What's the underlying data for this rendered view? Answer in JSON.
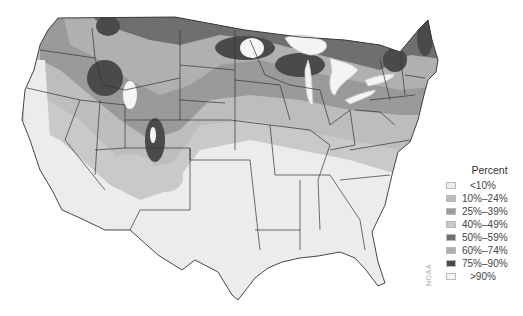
{
  "map": {
    "subject": "Contiguous United States",
    "colors": {
      "lt10": "#ececec",
      "p10_24": "#bdbdbd",
      "p25_39": "#9a9a9a",
      "p40_49": "#c9c9c9",
      "p50_59": "#6f6f6f",
      "p60_74": "#b0b0b0",
      "p75_90": "#4a4a4a",
      "gt90": "#f5f5f5",
      "border": "#333333",
      "lakes": "#f4f4f4"
    }
  },
  "legend": {
    "title": "Percent",
    "items": [
      {
        "label": "<10%",
        "color": "#ececec"
      },
      {
        "label": "10%–24%",
        "color": "#bdbdbd"
      },
      {
        "label": "25%–39%",
        "color": "#9a9a9a"
      },
      {
        "label": "40%–49%",
        "color": "#c9c9c9"
      },
      {
        "label": "50%–59%",
        "color": "#6f6f6f"
      },
      {
        "label": "60%–74%",
        "color": "#b0b0b0"
      },
      {
        "label": "75%–90%",
        "color": "#4a4a4a"
      },
      {
        "label": ">90%",
        "color": "#f5f5f5"
      }
    ]
  },
  "source": "NOAA"
}
